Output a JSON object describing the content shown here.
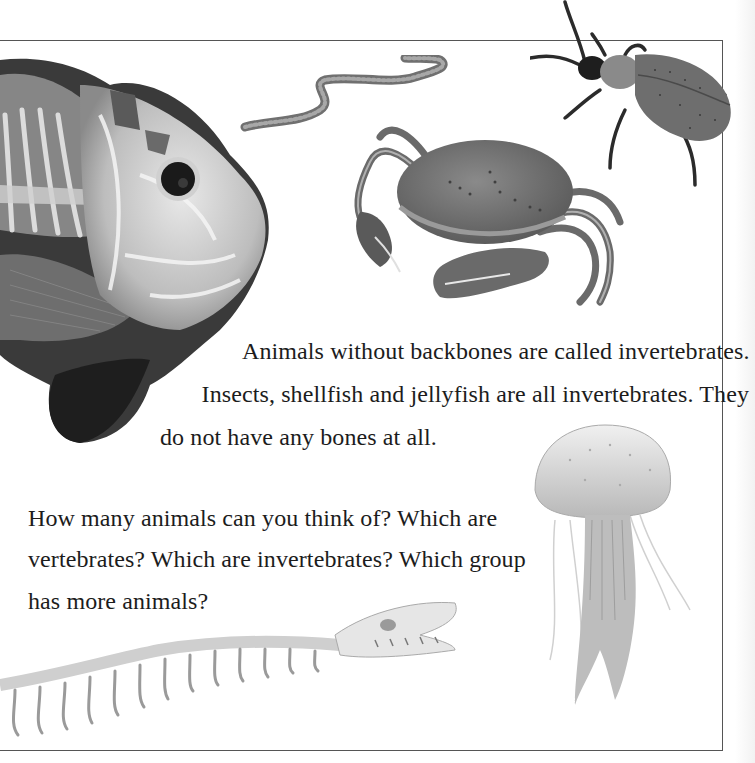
{
  "page": {
    "paragraphs": [
      {
        "id": "invertebrates-definition",
        "lines": [
          "Animals without backbones are called invertebrates.",
          "Insects, shellfish and jellyfish are all invertebrates. They",
          "do not have any bones at all."
        ]
      },
      {
        "id": "question-prompt",
        "lines": [
          "How many animals can you think of? Which are",
          "vertebrates? Which are invertebrates? Which group",
          "has more animals?"
        ]
      }
    ],
    "illustrations": [
      {
        "name": "fish-skeleton-xray",
        "subject": "fish with x-ray skeleton view"
      },
      {
        "name": "earthworm",
        "subject": "earthworm"
      },
      {
        "name": "crab",
        "subject": "crab"
      },
      {
        "name": "beetle",
        "subject": "beetle"
      },
      {
        "name": "jellyfish",
        "subject": "jellyfish"
      },
      {
        "name": "snake-skeleton",
        "subject": "snake skeleton"
      }
    ],
    "colors": {
      "frame": "#555555",
      "text": "#1c1c1c",
      "illustration_dark": "#2b2b2b",
      "illustration_mid": "#7a7a7a",
      "illustration_light": "#d6d6d6"
    }
  }
}
